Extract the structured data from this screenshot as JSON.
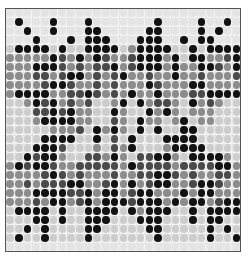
{
  "figure": {
    "rows": 27,
    "cols": 27,
    "level_colors": [
      "#e4e4e4",
      "#cdcdcd",
      "#8c8c8c",
      "#4a4a4a",
      "#121212"
    ],
    "origin": {
      "x": 4,
      "y": 4
    },
    "spacing": {
      "x": 8.7,
      "y": 9.0
    },
    "grid": [
      "000000000000000000000000000",
      "040004000400000004000040040",
      "004004000440000044000040400",
      "000400040444000444004044000",
      "144441411444412444411414444",
      "222224324243223444241442234",
      "222444323233423444242244324",
      "222332344232342232242232223",
      "222234432232322243222442222",
      "244442233432324224222334444",
      "112434232311241423321423211",
      "111334342211421142421222111",
      "111244442211321422124122111",
      "111112223142421414114411111",
      "111144441141314111444411111",
      "111444311121324111244441111",
      "114344211332421334421444421",
      "243443223333324333323333442",
      "222234323222322334432322332",
      "223233344223424234422344322",
      "222444433424423442224244222",
      "222324423424443444242442344",
      "144441411444414244411414444",
      "111441411444111444111414411",
      "114141111441111144111114141",
      "141141111411111114111114114",
      "000000000000000000000000000"
    ]
  }
}
